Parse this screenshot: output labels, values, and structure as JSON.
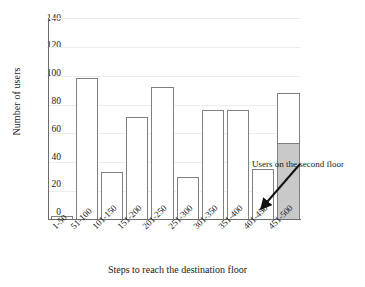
{
  "chart_data": {
    "type": "bar",
    "title": "",
    "xlabel": "Steps to reach the destination floor",
    "ylabel": "Number of users",
    "categories": [
      "1-50",
      "51-100",
      "101-150",
      "151-200",
      "201-250",
      "251-300",
      "301-350",
      "351-400",
      "401-450",
      "451-500"
    ],
    "values": [
      2,
      98,
      33,
      71,
      92,
      29,
      76,
      76,
      35,
      88
    ],
    "series": [
      {
        "name": "Number of users",
        "values": [
          2,
          98,
          33,
          71,
          92,
          29,
          76,
          76,
          35,
          88
        ]
      },
      {
        "name": "Users on the second floor",
        "values": [
          0,
          0,
          0,
          0,
          0,
          0,
          0,
          0,
          0,
          53
        ]
      }
    ],
    "ylim": [
      0,
      140
    ],
    "yticks": [
      0,
      20,
      40,
      60,
      80,
      100,
      120,
      140
    ],
    "ytick_labels": [
      "0",
      "20",
      "40",
      "60",
      "80",
      "100",
      "120",
      "140"
    ],
    "grid": true,
    "legend": "none",
    "annotations": [
      {
        "text": "Users on the second floor",
        "points_to_category": "451-500",
        "points_to_segment": "Users on the second floor"
      }
    ],
    "colors": {
      "bar_fill": "#ffffff",
      "bar_stroke": "#808080",
      "shaded_fill": "#c9c9c9",
      "axis": "#6b6b6b",
      "grid": "#ededed",
      "text": "#1a1a1a"
    }
  }
}
